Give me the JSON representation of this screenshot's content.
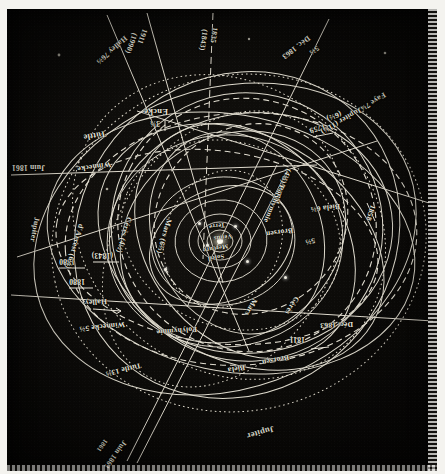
{
  "plate": {
    "title": "Orbites comparées des comètes périodiques et des planètes",
    "orientation": "inverted",
    "background_color": "#0b0a08",
    "ink_color": "#e8e6dc"
  },
  "center": {
    "sun": "Soleil",
    "inner_planets": [
      "Mercure",
      "Vénus",
      "Terre"
    ]
  },
  "labels": [
    {
      "id": "jupiter-top",
      "text": "Jupiter",
      "x": 163,
      "y": 38,
      "rot": -16,
      "size": "lg"
    },
    {
      "id": "juin-1861-top",
      "text": "Juin 1861",
      "x": 312,
      "y": 26,
      "rot": -54,
      "size": "md"
    },
    {
      "id": "1861-top",
      "text": "1861",
      "x": 331,
      "y": 28,
      "rot": -54,
      "size": "sm"
    },
    {
      "id": "tuttle-13",
      "text": "Tuttle 13⅔",
      "x": 296,
      "y": 102,
      "rot": -14,
      "size": "md"
    },
    {
      "id": "biela-top",
      "text": "Biela",
      "x": 192,
      "y": 100,
      "rot": -10,
      "size": "md"
    },
    {
      "id": "brorsen-top",
      "text": "Brorsen",
      "x": 148,
      "y": 110,
      "rot": -11,
      "size": "md"
    },
    {
      "id": "y-1811",
      "text": "1811",
      "x": 132,
      "y": 128,
      "rot": 0,
      "size": "md"
    },
    {
      "id": "dec-1863-top",
      "text": "Déc. 1863",
      "x": 84,
      "y": 143,
      "rot": -2,
      "size": "md"
    },
    {
      "id": "polyhymnie-top",
      "text": "Polyhymnie",
      "x": 240,
      "y": 138,
      "rot": -4,
      "size": "md"
    },
    {
      "id": "winnecke-5",
      "text": "Winnecke 5⅔",
      "x": 312,
      "y": 143,
      "rot": -6,
      "size": "md"
    },
    {
      "id": "halley-top",
      "text": "Halley",
      "x": 330,
      "y": 166,
      "rot": -4,
      "size": "md"
    },
    {
      "id": "y-1880-a",
      "text": "1880",
      "x": 352,
      "y": 186,
      "rot": 0,
      "size": "md"
    },
    {
      "id": "y-1880-b",
      "text": "1880",
      "x": 362,
      "y": 206,
      "rot": 0,
      "size": "md"
    },
    {
      "id": "y-1843",
      "text": "(1843)",
      "x": 324,
      "y": 212,
      "rot": 0,
      "size": "md"
    },
    {
      "id": "ceres-left",
      "text": "Cérès",
      "x": 140,
      "y": 170,
      "rot": -58,
      "size": "md"
    },
    {
      "id": "mars-left",
      "text": "Mars",
      "x": 182,
      "y": 168,
      "rot": -62,
      "size": "md"
    },
    {
      "id": "brorsen-mid",
      "text": "Brorsen",
      "x": 144,
      "y": 237,
      "rot": -8,
      "size": "md"
    },
    {
      "id": "five-thirds-a",
      "text": "5⅔",
      "x": 122,
      "y": 227,
      "rot": -12,
      "size": "md"
    },
    {
      "id": "biela-6",
      "text": "Biela 6⅔",
      "x": 97,
      "y": 261,
      "rot": -6,
      "size": "md"
    },
    {
      "id": "y-1858",
      "text": "1858",
      "x": 64,
      "y": 262,
      "rot": -72,
      "size": "md"
    },
    {
      "id": "darrest-left",
      "text": "d'Arrest",
      "x": 152,
      "y": 291,
      "rot": -74,
      "size": "md"
    },
    {
      "id": "polyhymnie-low",
      "text": "(4⅔) Polyhymnie",
      "x": 148,
      "y": 298,
      "rot": -66,
      "size": "md"
    },
    {
      "id": "mars-6",
      "text": "Mars (6⅔)",
      "x": 268,
      "y": 248,
      "rot": -74,
      "size": "md"
    },
    {
      "id": "ceres-4",
      "text": "Cérès (4½)",
      "x": 308,
      "y": 250,
      "rot": -74,
      "size": "md"
    },
    {
      "id": "darrest-right",
      "text": "d'Arrest (6½)",
      "x": 356,
      "y": 243,
      "rot": -74,
      "size": "md"
    },
    {
      "id": "jupiter-right",
      "text": "Jupiter",
      "x": 400,
      "y": 250,
      "rot": -80,
      "size": "md"
    },
    {
      "id": "winnecke-low",
      "text": "Winnecke",
      "x": 326,
      "y": 303,
      "rot": -8,
      "size": "md"
    },
    {
      "id": "juin-1861-right",
      "text": "Juin 1861",
      "x": 392,
      "y": 300,
      "rot": 0,
      "size": "md"
    },
    {
      "id": "tuttle-low",
      "text": "Tuttle",
      "x": 331,
      "y": 333,
      "rot": -10,
      "size": "lg"
    },
    {
      "id": "encke",
      "text": "Encke",
      "x": 269,
      "y": 355,
      "rot": 0,
      "size": "lg"
    },
    {
      "id": "encke-period",
      "text": "3⅓",
      "x": 277,
      "y": 344,
      "rot": 0,
      "size": "md"
    },
    {
      "id": "y-1759",
      "text": "1759",
      "x": 112,
      "y": 341,
      "rot": -16,
      "size": "md"
    },
    {
      "id": "six-half",
      "text": "(6½)",
      "x": 96,
      "y": 354,
      "rot": -22,
      "size": "md"
    },
    {
      "id": "jupiter-11",
      "text": "Jupiter (11¾)",
      "x": 76,
      "y": 358,
      "rot": -30,
      "size": "md"
    },
    {
      "id": "faye-7",
      "text": "Faye 7¼",
      "x": 52,
      "y": 373,
      "rot": -32,
      "size": "md"
    },
    {
      "id": "dec-1863-bot",
      "text": "Déc. 1863",
      "x": 128,
      "y": 430,
      "rot": -38,
      "size": "md"
    },
    {
      "id": "five-thirds-b",
      "text": "5⅔",
      "x": 119,
      "y": 420,
      "rot": -38,
      "size": "md"
    },
    {
      "id": "y-1835",
      "text": "1835",
      "x": 222,
      "y": 440,
      "rot": -82,
      "size": "md"
    },
    {
      "id": "y-1843-b",
      "text": "(1843)",
      "x": 232,
      "y": 438,
      "rot": -82,
      "size": "md"
    },
    {
      "id": "y-1911",
      "text": "1911",
      "x": 292,
      "y": 438,
      "rot": -70,
      "size": "md"
    },
    {
      "id": "y-1990",
      "text": "(1990)",
      "x": 302,
      "y": 434,
      "rot": -70,
      "size": "md"
    },
    {
      "id": "halley-76",
      "text": "Halley 76⅔",
      "x": 311,
      "y": 430,
      "rot": -42,
      "size": "md"
    }
  ],
  "center_labels": [
    {
      "id": "soleil",
      "text": "Soleil",
      "x": 213,
      "y": 212,
      "rot": -10,
      "size": "sm"
    },
    {
      "id": "mercure",
      "text": "Mercure",
      "x": 209,
      "y": 222,
      "rot": -10,
      "size": "sm"
    },
    {
      "id": "venus",
      "text": "Vénus",
      "x": 205,
      "y": 232,
      "rot": -8,
      "size": "sm"
    },
    {
      "id": "terre",
      "text": "Terre",
      "x": 212,
      "y": 243,
      "rot": -6,
      "size": "sm"
    }
  ]
}
